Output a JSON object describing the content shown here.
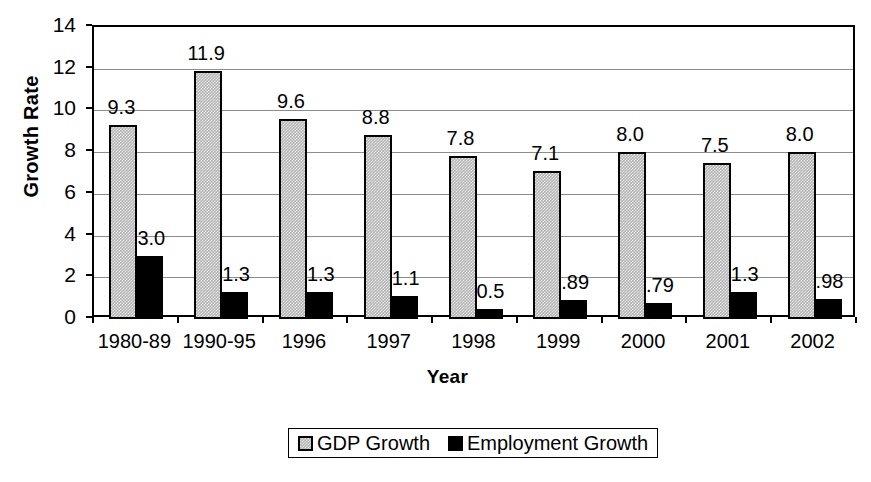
{
  "chart_data": {
    "type": "bar",
    "title": "",
    "xlabel": "Year",
    "ylabel": "Growth Rate",
    "ylim": [
      0,
      14
    ],
    "yticks": [
      0,
      2,
      4,
      6,
      8,
      10,
      12,
      14
    ],
    "ytick_labels": [
      "0",
      "2",
      "4",
      "6",
      "8",
      "10",
      "12",
      "14"
    ],
    "grid": true,
    "legend_position": "bottom-center",
    "categories": [
      "1980-89",
      "1990-95",
      "1996",
      "1997",
      "1998",
      "1999",
      "2000",
      "2001",
      "2002"
    ],
    "series": [
      {
        "name": "GDP Growth",
        "swatch": "gdp-pattern-swatch",
        "color": "#b4b4b4",
        "values": [
          9.3,
          11.9,
          9.6,
          8.8,
          7.8,
          7.1,
          8.0,
          7.5,
          8.0
        ],
        "labels": [
          "9.3",
          "11.9",
          "9.6",
          "8.8",
          "7.8",
          "7.1",
          "8.0",
          "7.5",
          "8.0"
        ]
      },
      {
        "name": "Employment Growth",
        "swatch": "emp-solid-swatch",
        "color": "#000000",
        "values": [
          3.0,
          1.3,
          1.3,
          1.1,
          0.5,
          0.89,
          0.79,
          1.3,
          0.98
        ],
        "labels": [
          "3.0",
          "1.3",
          "1.3",
          "1.1",
          "0.5",
          ".89",
          ".79",
          "1.3",
          ".98"
        ]
      }
    ]
  },
  "legend": {
    "items": [
      {
        "label": "GDP Growth"
      },
      {
        "label": "Employment Growth"
      }
    ]
  },
  "axes": {
    "y_title": "Growth Rate",
    "x_title": "Year"
  },
  "colors": {
    "axis": "#000000",
    "grid": "#8c8c8c",
    "background": "#ffffff",
    "gdp_bar": "#b4b4b4",
    "employment_bar": "#000000"
  }
}
